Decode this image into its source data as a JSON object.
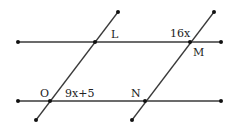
{
  "diagram": {
    "lines": [
      {
        "name": "top-parallel-line",
        "x1": 18,
        "y1": 42,
        "x2": 221,
        "y2": 42
      },
      {
        "name": "bottom-parallel-line",
        "x1": 18,
        "y1": 101,
        "x2": 221,
        "y2": 101
      },
      {
        "name": "left-transversal",
        "x1": 118,
        "y1": 12,
        "x2": 36,
        "y2": 120
      },
      {
        "name": "right-transversal",
        "x1": 214,
        "y1": 12,
        "x2": 132,
        "y2": 120
      }
    ],
    "points": {
      "L": {
        "label": "L",
        "x": 95,
        "y": 42
      },
      "M": {
        "label": "M",
        "x": 190,
        "y": 42
      },
      "O": {
        "label": "O",
        "x": 50,
        "y": 101
      },
      "N": {
        "label": "N",
        "x": 145,
        "y": 101
      }
    },
    "angles": {
      "at_M": "16x",
      "at_O": "9x+5"
    },
    "colors": {
      "line": "#333333",
      "point": "#111111"
    }
  }
}
